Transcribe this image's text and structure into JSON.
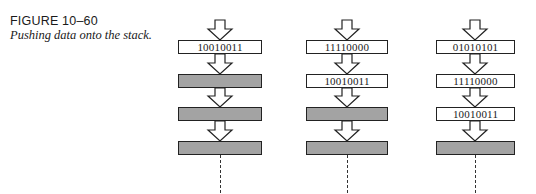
{
  "figure": {
    "label": "FIGURE 10–60",
    "title": "Pushing data onto the stack."
  },
  "colors": {
    "empty_cell_fill": "#a3a3a3",
    "filled_cell_fill": "#ffffff",
    "outline": "#222222"
  },
  "stacks": [
    {
      "name": "after-first-push",
      "cells": [
        {
          "value": "10010011",
          "state": "filled"
        },
        {
          "value": "",
          "state": "empty"
        },
        {
          "value": "",
          "state": "empty"
        },
        {
          "value": "",
          "state": "empty"
        }
      ]
    },
    {
      "name": "after-second-push",
      "cells": [
        {
          "value": "11110000",
          "state": "filled"
        },
        {
          "value": "10010011",
          "state": "filled"
        },
        {
          "value": "",
          "state": "empty"
        },
        {
          "value": "",
          "state": "empty"
        }
      ]
    },
    {
      "name": "after-third-push",
      "cells": [
        {
          "value": "01010101",
          "state": "filled"
        },
        {
          "value": "11110000",
          "state": "filled"
        },
        {
          "value": "10010011",
          "state": "filled"
        },
        {
          "value": "",
          "state": "empty"
        }
      ]
    }
  ]
}
